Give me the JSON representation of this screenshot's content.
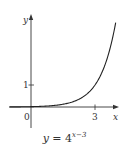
{
  "chart_data": {
    "type": "line",
    "function": "4^(x-3)",
    "xlabel": "x",
    "ylabel": "y",
    "x_ticks": [
      {
        "value": 3,
        "label": "3"
      }
    ],
    "y_ticks": [
      {
        "value": 1,
        "label": "1"
      }
    ],
    "origin_label": "0",
    "xlim": [
      -1,
      4.05
    ],
    "ylim": [
      -1,
      4.2
    ],
    "grid": false,
    "legend": "none",
    "series": [
      {
        "name": "y = 4^(x-3)",
        "x": [
          -1,
          0,
          1,
          2,
          2.5,
          3,
          3.5,
          3.97
        ],
        "y": [
          0.0039,
          0.0156,
          0.0625,
          0.25,
          0.5,
          1,
          2,
          3.84
        ]
      }
    ],
    "colors": {
      "curve": "#222222",
      "axes": "#333333"
    }
  },
  "labels": {
    "x_axis": "x",
    "y_axis": "y",
    "origin": "0",
    "tick_x3": "3",
    "tick_y1": "1",
    "caption_prefix": "y",
    "caption_eq": " = 4",
    "caption_exp": "x−3"
  }
}
